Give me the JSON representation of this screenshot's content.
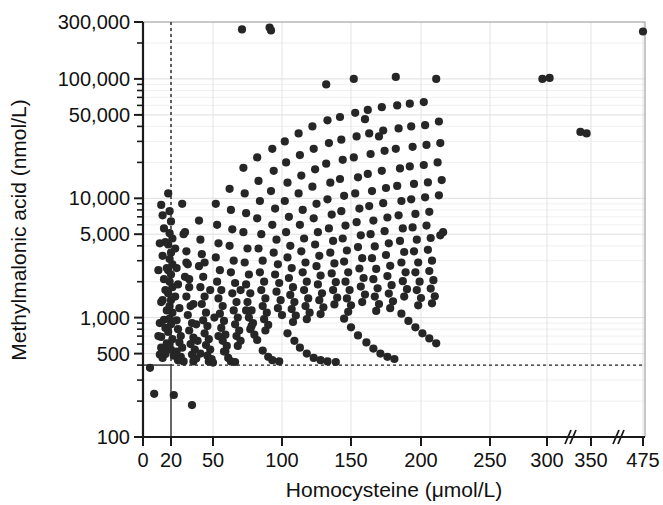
{
  "figure": {
    "kind": "scatter-plot",
    "background": "#ffffff",
    "point_color": "#262626",
    "point_radius_px": 4.1
  },
  "chart_data": {
    "type": "scatter",
    "title": "",
    "subtitle": "",
    "xlabel": "Homocysteine (μmol/L)",
    "ylabel": "Methylmalonic acid (nmol/L)",
    "xscale": "linear-with-breaks",
    "yscale": "log",
    "xlim": [
      0,
      475
    ],
    "ylim": [
      100,
      300000
    ],
    "grid": true,
    "legend": null,
    "x_ticks": [
      0,
      20,
      50,
      100,
      150,
      200,
      250,
      300,
      350,
      475
    ],
    "x_tick_labels": [
      "0",
      "20",
      "50",
      "100",
      "150",
      "200",
      "250",
      "300",
      "350",
      "475"
    ],
    "x_axis_breaks": [
      "between 300 and 350",
      "between 350 and 475"
    ],
    "x_break_symbol": "//",
    "y_ticks": [
      100,
      500,
      1000,
      5000,
      10000,
      50000,
      100000,
      300000
    ],
    "y_tick_labels": [
      "100",
      "500",
      "1,000",
      "5,000",
      "10,000",
      "50,000",
      "100,000",
      "300,000"
    ],
    "reference_lines": [
      {
        "orientation": "vertical",
        "value": 20,
        "style": "dashed",
        "note": "homocysteine cut-off 20 μmol/L"
      },
      {
        "orientation": "horizontal",
        "value": 400,
        "style": "dashed",
        "note": "methylmalonic acid cut-off ~400 nmol/L"
      }
    ],
    "n_points": 366,
    "points": [
      [
        5,
        380
      ],
      [
        8,
        230
      ],
      [
        22,
        225
      ],
      [
        35,
        185
      ],
      [
        18,
        11000
      ],
      [
        19,
        7800
      ],
      [
        20,
        6400
      ],
      [
        19,
        5100
      ],
      [
        21,
        4600
      ],
      [
        18,
        4100
      ],
      [
        20,
        3500
      ],
      [
        19,
        3100
      ],
      [
        21,
        2800
      ],
      [
        18,
        2500
      ],
      [
        20,
        2300
      ],
      [
        19,
        2000
      ],
      [
        21,
        1800
      ],
      [
        18,
        1600
      ],
      [
        20,
        1400
      ],
      [
        19,
        1250
      ],
      [
        21,
        1100
      ],
      [
        19,
        980
      ],
      [
        20,
        880
      ],
      [
        18,
        760
      ],
      [
        21,
        660
      ],
      [
        19,
        600
      ],
      [
        20,
        540
      ],
      [
        22,
        480
      ],
      [
        23,
        3800
      ],
      [
        24,
        2600
      ],
      [
        25,
        1900
      ],
      [
        23,
        1500
      ],
      [
        26,
        1200
      ],
      [
        24,
        950
      ],
      [
        25,
        800
      ],
      [
        27,
        700
      ],
      [
        26,
        620
      ],
      [
        28,
        560
      ],
      [
        24,
        520
      ],
      [
        27,
        470
      ],
      [
        25,
        440
      ],
      [
        29,
        430
      ],
      [
        30,
        5200
      ],
      [
        31,
        3600
      ],
      [
        32,
        2800
      ],
      [
        30,
        2200
      ],
      [
        33,
        1800
      ],
      [
        31,
        1500
      ],
      [
        34,
        1250
      ],
      [
        32,
        1050
      ],
      [
        35,
        900
      ],
      [
        33,
        780
      ],
      [
        36,
        680
      ],
      [
        34,
        600
      ],
      [
        37,
        540
      ],
      [
        35,
        490
      ],
      [
        38,
        455
      ],
      [
        36,
        430
      ],
      [
        40,
        6500
      ],
      [
        41,
        4500
      ],
      [
        42,
        3400
      ],
      [
        40,
        2700
      ],
      [
        43,
        2200
      ],
      [
        41,
        1800
      ],
      [
        44,
        1500
      ],
      [
        42,
        1300
      ],
      [
        45,
        1100
      ],
      [
        43,
        950
      ],
      [
        46,
        850
      ],
      [
        44,
        740
      ],
      [
        47,
        660
      ],
      [
        45,
        590
      ],
      [
        48,
        540
      ],
      [
        46,
        480
      ],
      [
        49,
        450
      ],
      [
        47,
        430
      ],
      [
        50,
        420
      ],
      [
        52,
        9000
      ],
      [
        53,
        6000
      ],
      [
        54,
        4200
      ],
      [
        52,
        3200
      ],
      [
        55,
        2500
      ],
      [
        53,
        2000
      ],
      [
        56,
        1700
      ],
      [
        54,
        1450
      ],
      [
        57,
        1250
      ],
      [
        55,
        1080
      ],
      [
        58,
        940
      ],
      [
        56,
        820
      ],
      [
        59,
        720
      ],
      [
        57,
        640
      ],
      [
        60,
        580
      ],
      [
        58,
        520
      ],
      [
        62,
        12000
      ],
      [
        63,
        8000
      ],
      [
        64,
        5500
      ],
      [
        62,
        4000
      ],
      [
        65,
        3000
      ],
      [
        63,
        2400
      ],
      [
        66,
        1950
      ],
      [
        64,
        1600
      ],
      [
        67,
        1350
      ],
      [
        65,
        1150
      ],
      [
        68,
        1000
      ],
      [
        66,
        880
      ],
      [
        69,
        780
      ],
      [
        67,
        700
      ],
      [
        70,
        640
      ],
      [
        68,
        580
      ],
      [
        71,
        260000
      ],
      [
        72,
        18000
      ],
      [
        73,
        11000
      ],
      [
        74,
        7500
      ],
      [
        72,
        5200
      ],
      [
        75,
        3800
      ],
      [
        73,
        2900
      ],
      [
        76,
        2300
      ],
      [
        74,
        1900
      ],
      [
        77,
        1600
      ],
      [
        75,
        1350
      ],
      [
        78,
        1150
      ],
      [
        76,
        1000
      ],
      [
        79,
        900
      ],
      [
        77,
        800
      ],
      [
        80,
        720
      ],
      [
        82,
        22000
      ],
      [
        83,
        14000
      ],
      [
        84,
        9500
      ],
      [
        82,
        6800
      ],
      [
        85,
        5000
      ],
      [
        83,
        3800
      ],
      [
        86,
        3000
      ],
      [
        84,
        2400
      ],
      [
        87,
        2000
      ],
      [
        85,
        1700
      ],
      [
        88,
        1450
      ],
      [
        86,
        1250
      ],
      [
        89,
        1100
      ],
      [
        87,
        970
      ],
      [
        90,
        870
      ],
      [
        88,
        780
      ],
      [
        91,
        270000
      ],
      [
        92,
        255000
      ],
      [
        93,
        26000
      ],
      [
        94,
        17000
      ],
      [
        92,
        11500
      ],
      [
        95,
        8200
      ],
      [
        93,
        6000
      ],
      [
        96,
        4500
      ],
      [
        94,
        3500
      ],
      [
        97,
        2800
      ],
      [
        95,
        2300
      ],
      [
        98,
        1950
      ],
      [
        96,
        1650
      ],
      [
        99,
        1400
      ],
      [
        97,
        1200
      ],
      [
        100,
        1050
      ],
      [
        102,
        30000
      ],
      [
        103,
        20000
      ],
      [
        104,
        13500
      ],
      [
        102,
        9500
      ],
      [
        105,
        7000
      ],
      [
        103,
        5200
      ],
      [
        106,
        4000
      ],
      [
        104,
        3200
      ],
      [
        107,
        2600
      ],
      [
        105,
        2150
      ],
      [
        108,
        1800
      ],
      [
        106,
        1550
      ],
      [
        109,
        1350
      ],
      [
        107,
        1180
      ],
      [
        110,
        1040
      ],
      [
        108,
        920
      ],
      [
        112,
        35000
      ],
      [
        113,
        23000
      ],
      [
        114,
        15500
      ],
      [
        112,
        11000
      ],
      [
        115,
        8000
      ],
      [
        113,
        6000
      ],
      [
        116,
        4600
      ],
      [
        114,
        3600
      ],
      [
        117,
        2900
      ],
      [
        115,
        2400
      ],
      [
        118,
        2000
      ],
      [
        116,
        1700
      ],
      [
        119,
        1450
      ],
      [
        117,
        1250
      ],
      [
        120,
        1100
      ],
      [
        118,
        970
      ],
      [
        122,
        40000
      ],
      [
        123,
        26000
      ],
      [
        124,
        17500
      ],
      [
        122,
        12500
      ],
      [
        125,
        9000
      ],
      [
        123,
        6800
      ],
      [
        126,
        5200
      ],
      [
        124,
        4100
      ],
      [
        127,
        3300
      ],
      [
        125,
        2700
      ],
      [
        128,
        2250
      ],
      [
        126,
        1900
      ],
      [
        129,
        1600
      ],
      [
        127,
        1400
      ],
      [
        130,
        1220
      ],
      [
        128,
        1070
      ],
      [
        132,
        90000
      ],
      [
        133,
        45000
      ],
      [
        134,
        29000
      ],
      [
        132,
        19500
      ],
      [
        135,
        13500
      ],
      [
        133,
        9800
      ],
      [
        136,
        7300
      ],
      [
        134,
        5600
      ],
      [
        137,
        4400
      ],
      [
        135,
        3500
      ],
      [
        138,
        2850
      ],
      [
        136,
        2350
      ],
      [
        139,
        1980
      ],
      [
        137,
        1700
      ],
      [
        140,
        1470
      ],
      [
        138,
        1290
      ],
      [
        142,
        48000
      ],
      [
        143,
        31000
      ],
      [
        144,
        21000
      ],
      [
        142,
        14500
      ],
      [
        145,
        10500
      ],
      [
        143,
        7800
      ],
      [
        146,
        5900
      ],
      [
        144,
        4600
      ],
      [
        147,
        3650
      ],
      [
        145,
        2950
      ],
      [
        148,
        2400
      ],
      [
        146,
        2000
      ],
      [
        149,
        1700
      ],
      [
        147,
        1450
      ],
      [
        150,
        1270
      ],
      [
        148,
        1120
      ],
      [
        152,
        100000
      ],
      [
        153,
        52000
      ],
      [
        154,
        33000
      ],
      [
        152,
        22000
      ],
      [
        155,
        15000
      ],
      [
        153,
        11000
      ],
      [
        156,
        8200
      ],
      [
        154,
        6300
      ],
      [
        157,
        4900
      ],
      [
        155,
        3900
      ],
      [
        158,
        3150
      ],
      [
        156,
        2580
      ],
      [
        159,
        2150
      ],
      [
        157,
        1820
      ],
      [
        160,
        1560
      ],
      [
        158,
        1350
      ],
      [
        162,
        55000
      ],
      [
        163,
        35000
      ],
      [
        164,
        23500
      ],
      [
        162,
        16000
      ],
      [
        165,
        11500
      ],
      [
        163,
        8600
      ],
      [
        166,
        6500
      ],
      [
        164,
        5000
      ],
      [
        167,
        3950
      ],
      [
        165,
        3150
      ],
      [
        168,
        2560
      ],
      [
        166,
        2100
      ],
      [
        169,
        1760
      ],
      [
        167,
        1500
      ],
      [
        170,
        1300
      ],
      [
        168,
        1140
      ],
      [
        172,
        58000
      ],
      [
        173,
        37000
      ],
      [
        174,
        25000
      ],
      [
        172,
        17000
      ],
      [
        175,
        12200
      ],
      [
        173,
        9100
      ],
      [
        176,
        6900
      ],
      [
        174,
        5300
      ],
      [
        177,
        4200
      ],
      [
        175,
        3350
      ],
      [
        178,
        2720
      ],
      [
        176,
        2230
      ],
      [
        179,
        1870
      ],
      [
        177,
        1590
      ],
      [
        180,
        1370
      ],
      [
        178,
        1200
      ],
      [
        182,
        104000
      ],
      [
        183,
        60000
      ],
      [
        184,
        38500
      ],
      [
        182,
        26000
      ],
      [
        185,
        17800
      ],
      [
        183,
        12700
      ],
      [
        186,
        9500
      ],
      [
        184,
        7200
      ],
      [
        187,
        5600
      ],
      [
        185,
        4400
      ],
      [
        188,
        3550
      ],
      [
        186,
        2900
      ],
      [
        189,
        2400
      ],
      [
        187,
        2020
      ],
      [
        190,
        1730
      ],
      [
        188,
        1500
      ],
      [
        192,
        62000
      ],
      [
        193,
        40000
      ],
      [
        194,
        27000
      ],
      [
        192,
        18500
      ],
      [
        195,
        13200
      ],
      [
        193,
        9800
      ],
      [
        196,
        7400
      ],
      [
        194,
        5700
      ],
      [
        197,
        4500
      ],
      [
        195,
        3600
      ],
      [
        198,
        2900
      ],
      [
        196,
        2400
      ],
      [
        199,
        2000
      ],
      [
        197,
        1700
      ],
      [
        200,
        1460
      ],
      [
        198,
        1270
      ],
      [
        202,
        64000
      ],
      [
        203,
        41000
      ],
      [
        204,
        28000
      ],
      [
        202,
        19000
      ],
      [
        205,
        13600
      ],
      [
        203,
        10200
      ],
      [
        206,
        7700
      ],
      [
        204,
        5900
      ],
      [
        207,
        4650
      ],
      [
        205,
        3700
      ],
      [
        208,
        3000
      ],
      [
        206,
        2460
      ],
      [
        209,
        2060
      ],
      [
        207,
        1750
      ],
      [
        210,
        1510
      ],
      [
        208,
        1320
      ],
      [
        211,
        100000
      ],
      [
        213,
        44000
      ],
      [
        214,
        29000
      ],
      [
        212,
        20000
      ],
      [
        215,
        14200
      ],
      [
        213,
        10600
      ],
      [
        216,
        5200
      ],
      [
        214,
        4900
      ],
      [
        296,
        100000
      ],
      [
        303,
        102000
      ],
      [
        338,
        36000
      ],
      [
        345,
        35000
      ],
      [
        475,
        250000
      ],
      [
        14,
        7200
      ],
      [
        15,
        5600
      ],
      [
        16,
        4300
      ],
      [
        14,
        3300
      ],
      [
        17,
        2600
      ],
      [
        15,
        2100
      ],
      [
        16,
        1700
      ],
      [
        14,
        1400
      ],
      [
        17,
        1150
      ],
      [
        15,
        960
      ],
      [
        16,
        820
      ],
      [
        13,
        690
      ],
      [
        17,
        610
      ],
      [
        15,
        545
      ],
      [
        16,
        495
      ],
      [
        14,
        460
      ],
      [
        13,
        8800
      ],
      [
        12,
        4200
      ],
      [
        11,
        2500
      ],
      [
        13,
        1350
      ],
      [
        12,
        900
      ],
      [
        11,
        700
      ],
      [
        13,
        560
      ],
      [
        12,
        490
      ],
      [
        28,
        9000
      ],
      [
        29,
        5000
      ],
      [
        31,
        2900
      ],
      [
        33,
        2100
      ],
      [
        36,
        1300
      ],
      [
        38,
        880
      ],
      [
        39,
        640
      ],
      [
        41,
        500
      ],
      [
        44,
        2900
      ],
      [
        48,
        1700
      ],
      [
        51,
        1000
      ],
      [
        54,
        700
      ],
      [
        59,
        520
      ],
      [
        61,
        460
      ],
      [
        63,
        430
      ],
      [
        66,
        425
      ],
      [
        70,
        1700
      ],
      [
        74,
        1150
      ],
      [
        78,
        850
      ],
      [
        82,
        650
      ],
      [
        86,
        530
      ],
      [
        90,
        470
      ],
      [
        93,
        440
      ],
      [
        98,
        430
      ],
      [
        104,
        740
      ],
      [
        109,
        640
      ],
      [
        113,
        560
      ],
      [
        118,
        500
      ],
      [
        123,
        460
      ],
      [
        128,
        440
      ],
      [
        133,
        430
      ],
      [
        139,
        425
      ],
      [
        145,
        980
      ],
      [
        150,
        830
      ],
      [
        155,
        710
      ],
      [
        161,
        620
      ],
      [
        166,
        550
      ],
      [
        171,
        500
      ],
      [
        176,
        470
      ],
      [
        181,
        450
      ],
      [
        186,
        1080
      ],
      [
        191,
        940
      ],
      [
        196,
        830
      ],
      [
        201,
        740
      ],
      [
        206,
        670
      ],
      [
        211,
        610
      ],
      [
        160,
        46000
      ],
      [
        170,
        33000
      ]
    ]
  },
  "axes": {
    "x_title": "Homocysteine (μmol/L)",
    "y_title": "Methylmalonic acid (nmol/L)"
  }
}
